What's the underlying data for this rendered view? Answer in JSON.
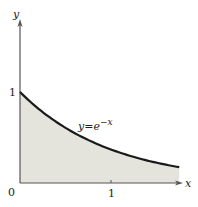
{
  "figure": {
    "axes": {
      "x_label": "x",
      "y_label": "y",
      "origin_label": "0",
      "x_tick_label": "1",
      "y_tick_label": "1"
    },
    "curve": {
      "label_base": "y",
      "label_eq": "=",
      "label_e": "e",
      "label_exp": "−x",
      "function": "y = e^-x"
    },
    "colors": {
      "fill": "#e4e4dc",
      "curve": "#1a1a1a",
      "axis": "#555555"
    }
  },
  "chart_data": {
    "type": "area",
    "title": "",
    "xlabel": "x",
    "ylabel": "y",
    "function": "y = e^(-x)",
    "x": [
      0,
      0.25,
      0.5,
      0.75,
      1.0,
      1.25,
      1.5,
      1.75
    ],
    "values": [
      1.0,
      0.779,
      0.607,
      0.472,
      0.368,
      0.287,
      0.223,
      0.174
    ],
    "xlim": [
      0,
      1.8
    ],
    "ylim": [
      0,
      1.8
    ],
    "x_ticks": [
      "0",
      "1"
    ],
    "y_ticks": [
      "1"
    ],
    "annotations": [
      "y=e^-x"
    ],
    "shaded_region": "area under curve from x=0 to x≈1.75",
    "grid": false,
    "legend": "none"
  }
}
